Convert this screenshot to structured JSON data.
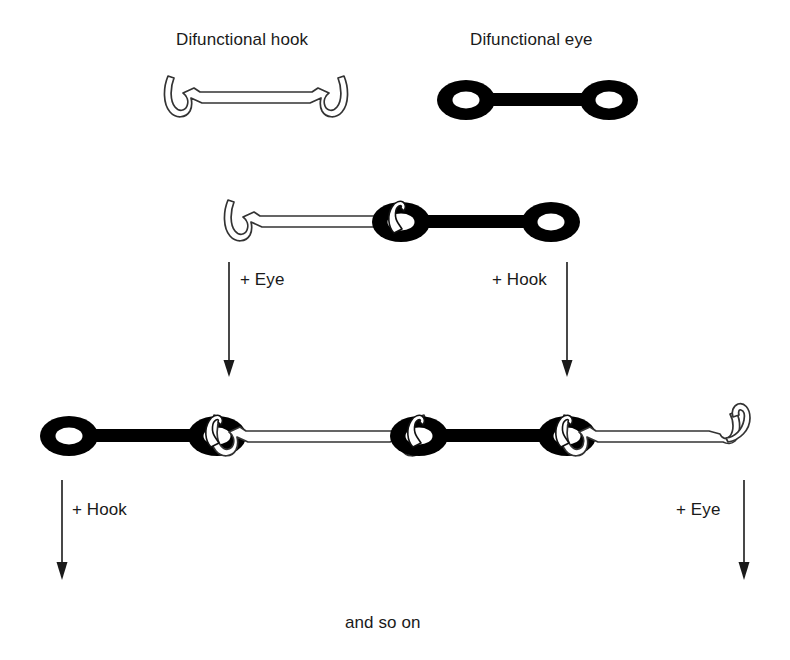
{
  "figure": {
    "type": "schematic-diagram",
    "background_color": "#ffffff",
    "ink_color": "#000000",
    "outline_color": "#333333"
  },
  "titles": {
    "hook": "Difunctional hook",
    "eye": "Difunctional eye"
  },
  "reactions": {
    "row1_left": "+ Eye",
    "row1_right": "+ Hook",
    "row2_left": "+ Hook",
    "row2_right": "+ Eye"
  },
  "footer": {
    "and_so_on": "and so on"
  },
  "monomers": [
    {
      "name": "difunctional-hook",
      "fill": "#ffffff",
      "stroke": "#333333",
      "ends": [
        "hook",
        "hook"
      ]
    },
    {
      "name": "difunctional-eye",
      "fill": "#000000",
      "stroke": "#000000",
      "ends": [
        "eye",
        "eye"
      ]
    }
  ],
  "chains": {
    "dimer": {
      "units": [
        "difunctional-hook",
        "difunctional-eye"
      ],
      "linkages": 1
    },
    "tetramer": {
      "units": [
        "difunctional-eye",
        "difunctional-hook",
        "difunctional-eye",
        "difunctional-hook"
      ],
      "linkages": 3,
      "free_ends": [
        "eye",
        "hook"
      ]
    }
  }
}
